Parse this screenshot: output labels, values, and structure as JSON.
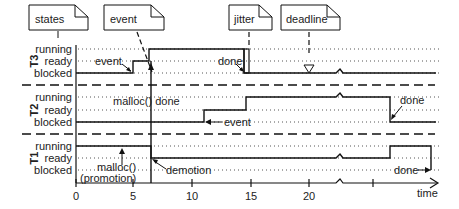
{
  "notes": {
    "states": "states",
    "event": "event",
    "jitter": "jitter",
    "deadline": "deadline"
  },
  "tasks": [
    {
      "name": "T3",
      "states": [
        "running",
        "ready",
        "blocked"
      ]
    },
    {
      "name": "T2",
      "states": [
        "running",
        "ready",
        "blocked"
      ]
    },
    {
      "name": "T1",
      "states": [
        "running",
        "ready",
        "blocked"
      ]
    }
  ],
  "annotations": {
    "t3_event": "event",
    "t3_done": "done",
    "t2_malloc_done": "malloc() done",
    "t2_event": "event",
    "t2_done": "done",
    "t1_malloc": "malloc()",
    "t1_promotion": "(promotion)",
    "t1_demotion": "demotion",
    "t1_done": "done"
  },
  "axis": {
    "ticks": [
      "0",
      "5",
      "10",
      "15",
      "20"
    ],
    "label": "time"
  }
}
